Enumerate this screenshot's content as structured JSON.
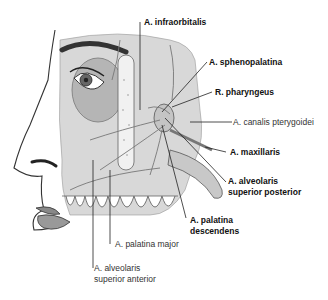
{
  "diagram": {
    "labels": [
      {
        "id": "infraorbitalis",
        "text": "A. infraorbitalis",
        "bold": true
      },
      {
        "id": "sphenopalatina",
        "text": "A. sphenopalatina",
        "bold": true
      },
      {
        "id": "pharyngeus",
        "text": "R. pharyngeus",
        "bold": true
      },
      {
        "id": "canalis",
        "text": "A. canalis pterygoidei",
        "bold": false
      },
      {
        "id": "maxillaris",
        "text": "A. maxillaris",
        "bold": true
      },
      {
        "id": "alv_post_1",
        "text": "A. alveolaris",
        "bold": true
      },
      {
        "id": "alv_post_2",
        "text": "superior posterior",
        "bold": true
      },
      {
        "id": "pal_desc_1",
        "text": "A. palatina",
        "bold": true
      },
      {
        "id": "pal_desc_2",
        "text": "descendens",
        "bold": true
      },
      {
        "id": "pal_major",
        "text": "A. palatina major",
        "bold": false
      },
      {
        "id": "alv_ant_1",
        "text": "A. alveolaris",
        "bold": false
      },
      {
        "id": "alv_ant_2",
        "text": "superior anterior",
        "bold": false
      }
    ]
  }
}
